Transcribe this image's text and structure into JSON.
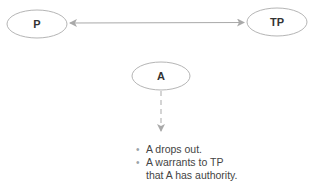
{
  "nodes": {
    "principal": {
      "label": "P"
    },
    "third_party": {
      "label": "TP"
    },
    "agent": {
      "label": "A"
    }
  },
  "connectors": {
    "principal_third_party": {
      "style": "solid",
      "direction": "bidirectional"
    },
    "agent_down": {
      "style": "dashed",
      "direction": "down"
    }
  },
  "notes": {
    "items": [
      {
        "text": "A drops out."
      },
      {
        "text": "A warrants to TP"
      },
      {
        "text": "that A has authority.",
        "continuation": true
      }
    ]
  },
  "colors": {
    "stroke": "#a9a9a9",
    "text": "#333333",
    "bullet": "#9aa3a8"
  }
}
